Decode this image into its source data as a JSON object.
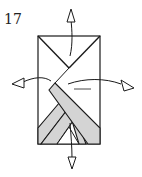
{
  "diagram": {
    "step_number": "17",
    "colors": {
      "line": "#1a1a1a",
      "fill_paper": "#ffffff",
      "fill_folded": "#d4d4d4"
    },
    "arrows": [
      {
        "direction": "up",
        "label": "unfold-up"
      },
      {
        "direction": "left",
        "label": "unfold-left"
      },
      {
        "direction": "right",
        "label": "unfold-right"
      },
      {
        "direction": "down",
        "label": "unfold-down"
      }
    ]
  }
}
